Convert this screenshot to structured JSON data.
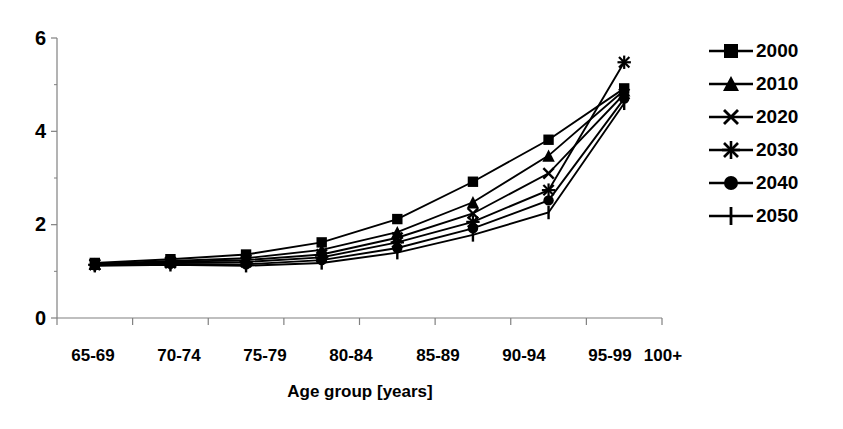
{
  "chart_data": {
    "type": "line",
    "title": "",
    "subtitle": "",
    "xlabel": "Age group [years]",
    "ylabel": "",
    "categories": [
      "65-69",
      "70-74",
      "75-79",
      "80-84",
      "85-89",
      "90-94",
      "95-99",
      "100+"
    ],
    "ylim": [
      0,
      6
    ],
    "yticks": [
      0,
      2,
      4,
      6
    ],
    "ytick_labels": [
      "0",
      "2",
      "4",
      "6"
    ],
    "grid": false,
    "legend_position": "right",
    "series": [
      {
        "name": "2000",
        "marker": "square-marker",
        "values": [
          1.18,
          1.26,
          1.36,
          1.62,
          2.12,
          2.92,
          3.82,
          4.92
        ]
      },
      {
        "name": "2010",
        "marker": "triangle-marker",
        "values": [
          1.16,
          1.22,
          1.28,
          1.46,
          1.84,
          2.48,
          3.48,
          4.88
        ]
      },
      {
        "name": "2020",
        "marker": "cross-x-marker",
        "values": [
          1.15,
          1.2,
          1.24,
          1.36,
          1.72,
          2.24,
          3.1,
          4.8
        ]
      },
      {
        "name": "2030",
        "marker": "asterisk-marker",
        "values": [
          1.14,
          1.18,
          1.2,
          1.3,
          1.62,
          2.06,
          2.74,
          5.48
        ]
      },
      {
        "name": "2040",
        "marker": "circle-marker",
        "values": [
          1.13,
          1.16,
          1.15,
          1.24,
          1.5,
          1.92,
          2.52,
          4.7
        ]
      },
      {
        "name": "2050",
        "marker": "plus-marker",
        "values": [
          1.12,
          1.14,
          1.12,
          1.18,
          1.4,
          1.78,
          2.26,
          4.6
        ]
      }
    ]
  },
  "axis": {
    "y_labels": [
      "6",
      "4",
      "2",
      "0"
    ]
  },
  "legend": {
    "items": [
      {
        "label": "2000"
      },
      {
        "label": "2010"
      },
      {
        "label": "2020"
      },
      {
        "label": "2030"
      },
      {
        "label": "2040"
      },
      {
        "label": "2050"
      }
    ]
  },
  "colors": {
    "series": "#000000",
    "axis": "#808080",
    "background": "#ffffff"
  }
}
